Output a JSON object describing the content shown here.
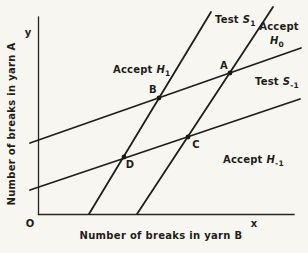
{
  "colors": {
    "background": "#f8f6f1",
    "ink": "#1f1d1a"
  },
  "axes": {
    "y_symbol": "y",
    "x_symbol": "x",
    "origin_label": "O",
    "y_axis_title": "Number of breaks in yarn A",
    "x_axis_title": "Number of breaks in yarn B"
  },
  "labels": {
    "test_s1": {
      "word": "Test",
      "sym": "S",
      "sub": "1"
    },
    "accept_h0": {
      "word": "Accept",
      "sym": "H",
      "sub": "0"
    },
    "accept_h1": {
      "word": "Accept",
      "sym": "H",
      "sub": "1"
    },
    "test_s_neg1": {
      "word": "Test",
      "sym": "S",
      "sub": "-1"
    },
    "accept_h_neg1": {
      "word": "Accept",
      "sym": "H",
      "sub": "-1"
    }
  },
  "points": {
    "a": "A",
    "b": "B",
    "c": "C",
    "d": "D"
  }
}
